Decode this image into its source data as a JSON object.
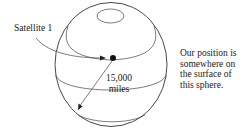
{
  "diagram": {
    "satellite_label": "Satellite 1",
    "distance": {
      "value": "15,000",
      "unit": "miles"
    },
    "note_lines": [
      "Our position is",
      "somewhere on",
      "the surface of",
      "this sphere."
    ],
    "colors": {
      "stroke": "#333333",
      "text": "#1a1a1a",
      "background": "#ffffff"
    }
  }
}
